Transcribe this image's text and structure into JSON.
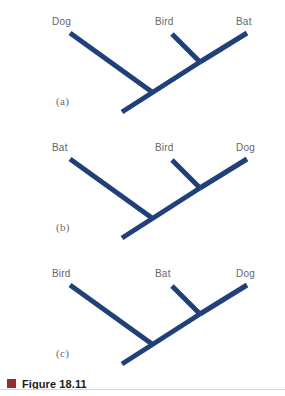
{
  "figure": {
    "caption": "Figure 18.11",
    "swatch_color": "#8e3030",
    "branch_color": "#20407a",
    "label_color": "#66666a",
    "background_color": "#ffffff"
  },
  "panels": [
    {
      "letter": "(a)",
      "leaves": {
        "left": "Dog",
        "middle": "Bird",
        "right": "Bat"
      }
    },
    {
      "letter": "(b)",
      "leaves": {
        "left": "Bat",
        "middle": "Bird",
        "right": "Dog"
      }
    },
    {
      "letter": "(c)",
      "leaves": {
        "left": "Bird",
        "middle": "Bat",
        "right": "Dog"
      }
    }
  ]
}
